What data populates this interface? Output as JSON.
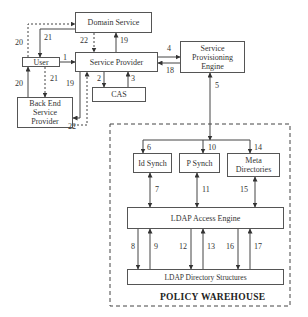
{
  "diagram": {
    "nodes": {
      "domain_service": "Domain Service",
      "service_provider": "Service Provider",
      "user": "User",
      "back_end_service_provider": "Back End Service Provider",
      "cas": "CAS",
      "service_provisioning_engine": "Service Provisioning Engine",
      "id_synch": "Id Synch",
      "p_synch": "P Synch",
      "meta_directories": "Meta Directories",
      "ldap_access_engine": "LDAP Access Engine",
      "ldap_directory_structures": "LDAP Directory Structures"
    },
    "group_title": "POLICY WAREHOUSE",
    "edge_labels": {
      "e1": "1",
      "e2": "2",
      "e3": "3",
      "e4": "4",
      "e5": "5",
      "e6": "6",
      "e7": "7",
      "e8": "8",
      "e9": "9",
      "e10": "10",
      "e11": "11",
      "e12": "12",
      "e13": "13",
      "e14": "14",
      "e15": "15",
      "e16": "16",
      "e17": "17",
      "e18": "18",
      "e19a": "19",
      "e19b": "19",
      "e20a": "20",
      "e20b": "20",
      "e21a": "21",
      "e21b": "21",
      "e22a": "22",
      "e22b": "22"
    },
    "edges": [
      {
        "from": "User",
        "to": "Service Provider",
        "label": "1",
        "style": "solid"
      },
      {
        "from": "Service Provider",
        "to": "CAS",
        "label": "2",
        "style": "solid"
      },
      {
        "from": "CAS",
        "to": "Service Provider",
        "label": "3",
        "style": "solid"
      },
      {
        "from": "Service Provider",
        "to": "Service Provisioning Engine",
        "label": "4",
        "style": "solid"
      },
      {
        "from": "Service Provisioning Engine",
        "to": "Policy Warehouse",
        "label": "5",
        "style": "solid-bidirectional"
      },
      {
        "from": "Policy Warehouse",
        "to": "Id Synch",
        "label": "6",
        "style": "solid"
      },
      {
        "from": "Id Synch",
        "to": "LDAP Access Engine",
        "label": "7",
        "style": "solid-bidirectional"
      },
      {
        "from": "LDAP Access Engine",
        "to": "LDAP Directory Structures",
        "label": "8",
        "style": "solid"
      },
      {
        "from": "LDAP Directory Structures",
        "to": "LDAP Access Engine",
        "label": "9",
        "style": "solid"
      },
      {
        "from": "Policy Warehouse",
        "to": "P Synch",
        "label": "10",
        "style": "solid"
      },
      {
        "from": "P Synch",
        "to": "LDAP Access Engine",
        "label": "11",
        "style": "solid-bidirectional"
      },
      {
        "from": "LDAP Access Engine",
        "to": "LDAP Directory Structures",
        "label": "12",
        "style": "solid"
      },
      {
        "from": "LDAP Directory Structures",
        "to": "LDAP Access Engine",
        "label": "13",
        "style": "solid"
      },
      {
        "from": "Policy Warehouse",
        "to": "Meta Directories",
        "label": "14",
        "style": "solid"
      },
      {
        "from": "Meta Directories",
        "to": "LDAP Access Engine",
        "label": "15",
        "style": "solid-bidirectional"
      },
      {
        "from": "LDAP Access Engine",
        "to": "LDAP Directory Structures",
        "label": "16",
        "style": "solid"
      },
      {
        "from": "LDAP Directory Structures",
        "to": "LDAP Access Engine",
        "label": "17",
        "style": "solid"
      },
      {
        "from": "Service Provisioning Engine",
        "to": "Service Provider",
        "label": "18",
        "style": "solid"
      },
      {
        "from": "Service Provider",
        "to": "Domain Service",
        "label": "19",
        "style": "solid"
      },
      {
        "from": "Service Provider",
        "to": "Back End Service Provider",
        "label": "19",
        "style": "solid"
      },
      {
        "from": "User",
        "to": "Domain Service",
        "label": "20",
        "style": "dashed"
      },
      {
        "from": "Back End Service Provider",
        "to": "User",
        "label": "20",
        "style": "solid"
      },
      {
        "from": "Domain Service",
        "to": "User",
        "label": "21",
        "style": "solid"
      },
      {
        "from": "User",
        "to": "Back End Service Provider",
        "label": "21",
        "style": "dashed"
      },
      {
        "from": "Domain Service",
        "to": "Service Provider",
        "label": "22",
        "style": "dashed"
      },
      {
        "from": "Back End Service Provider",
        "to": "Service Provider",
        "label": "22",
        "style": "dashed"
      }
    ]
  }
}
